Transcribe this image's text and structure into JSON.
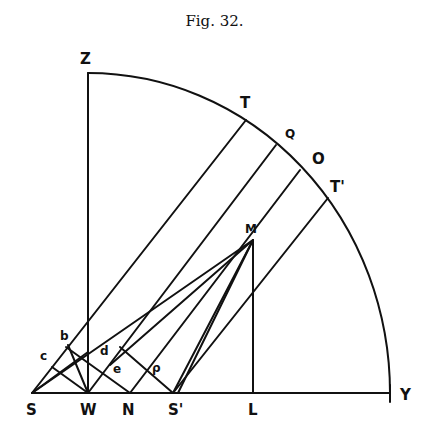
{
  "figure": {
    "title": "Fig. 32.",
    "labels": {
      "Z": "Z",
      "T": "T",
      "Q": "Q",
      "O": "O",
      "T_prime": "T'",
      "M": "M",
      "L": "L",
      "Y": "Y",
      "S": "S",
      "W": "W",
      "N": "N",
      "S_prime": "S'",
      "b": "b",
      "c_outer": "c",
      "d": "d",
      "e": "e",
      "f": "ρ"
    },
    "points": {
      "W": [
        88,
        393
      ],
      "Z": [
        88,
        73
      ],
      "Y": [
        390,
        393
      ],
      "S": [
        32,
        393
      ],
      "N": [
        130,
        393
      ],
      "S_prime": [
        173,
        393
      ],
      "L": [
        253,
        393
      ],
      "M": [
        253,
        240
      ],
      "T": [
        246,
        120
      ],
      "Q": [
        276,
        145
      ],
      "O": [
        300,
        170
      ],
      "T_prime": [
        328,
        198
      ]
    },
    "line_color": "#111111",
    "background": "#ffffff"
  }
}
